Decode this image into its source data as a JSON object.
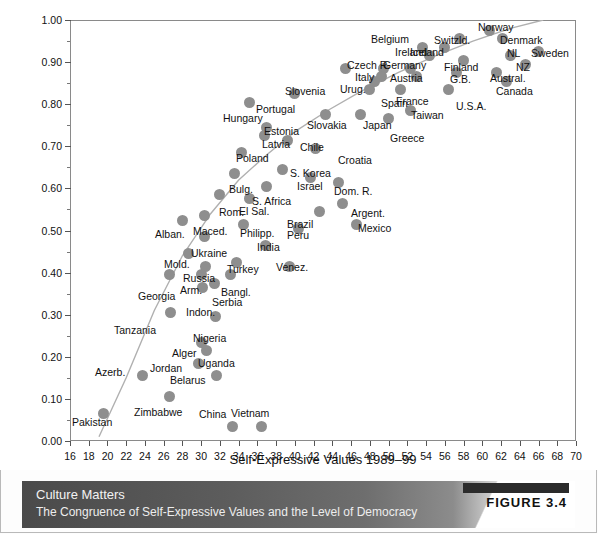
{
  "figure": {
    "tag": "FIGURE 3.4",
    "caption_title": "Culture Matters",
    "caption_subtitle": "The Congruence of Self-Expressive Values and the Level of Democracy"
  },
  "chart_data": {
    "type": "scatter",
    "title": "",
    "xlabel": "Self-Expressive Values 1989–99",
    "ylabel": "Level of Democracy 2000–04",
    "xlim": [
      16,
      70
    ],
    "ylim": [
      0.0,
      1.0
    ],
    "xticks": [
      16,
      18,
      20,
      22,
      24,
      26,
      28,
      30,
      32,
      34,
      36,
      38,
      40,
      42,
      44,
      46,
      48,
      50,
      52,
      54,
      56,
      58,
      60,
      62,
      64,
      66,
      68,
      70
    ],
    "yticks": [
      "0.00",
      "0.10",
      "0.20",
      "0.30",
      "0.40",
      "0.50",
      "0.60",
      "0.70",
      "0.80",
      "0.90",
      "1.00"
    ],
    "ytick_values": [
      0.0,
      0.1,
      0.2,
      0.3,
      0.4,
      0.5,
      0.6,
      0.7,
      0.8,
      0.9,
      1.0
    ],
    "grid": false,
    "legend": null,
    "marker_color": "#8e8e8e",
    "trend_line": {
      "style": "curve",
      "color": "#b0b0b0",
      "points": [
        [
          19.1,
          0.01
        ],
        [
          22.0,
          0.15
        ],
        [
          25.0,
          0.31
        ],
        [
          28.0,
          0.44
        ],
        [
          31.0,
          0.54
        ],
        [
          34.0,
          0.62
        ],
        [
          37.0,
          0.68
        ],
        [
          40.0,
          0.735
        ],
        [
          43.5,
          0.785
        ],
        [
          47.0,
          0.83
        ],
        [
          51.0,
          0.875
        ],
        [
          55.0,
          0.915
        ],
        [
          59.0,
          0.95
        ],
        [
          63.0,
          0.98
        ],
        [
          66.5,
          1.0
        ]
      ]
    },
    "points": [
      {
        "label": "Norway",
        "x": 60.8,
        "y": 0.975,
        "lx": 478,
        "ly": 22
      },
      {
        "label": "Switzld.",
        "x": 57.6,
        "y": 0.955,
        "lx": 434,
        "ly": 35
      },
      {
        "label": "Denmark",
        "x": 62.2,
        "y": 0.955,
        "lx": 500,
        "ly": 35
      },
      {
        "label": "Sweden",
        "x": 66.0,
        "y": 0.925,
        "lx": 531,
        "ly": 48
      },
      {
        "label": "Iceland",
        "x": 56.0,
        "y": 0.935,
        "lx": 410,
        "ly": 47
      },
      {
        "label": "Belgium",
        "x": 53.6,
        "y": 0.935,
        "lx": 371,
        "ly": 34
      },
      {
        "label": "Ireland",
        "x": 54.4,
        "y": 0.915,
        "lx": 395,
        "ly": 47
      },
      {
        "label": "NL",
        "x": 63.0,
        "y": 0.915,
        "lx": 507,
        "ly": 48
      },
      {
        "label": "Finland",
        "x": 58.0,
        "y": 0.905,
        "lx": 444,
        "ly": 62
      },
      {
        "label": "NZ",
        "x": 64.6,
        "y": 0.895,
        "lx": 516,
        "ly": 62
      },
      {
        "label": "Czech R.",
        "x": 49.5,
        "y": 0.885,
        "lx": 347,
        "ly": 60
      },
      {
        "label": "Germany",
        "x": 52.3,
        "y": 0.885,
        "lx": 383,
        "ly": 60
      },
      {
        "label": "Italy",
        "x": 49.2,
        "y": 0.865,
        "lx": 355,
        "ly": 72
      },
      {
        "label": "Austria",
        "x": 53.0,
        "y": 0.865,
        "lx": 390,
        "ly": 73
      },
      {
        "label": "G.B.",
        "x": 57.2,
        "y": 0.875,
        "lx": 450,
        "ly": 74
      },
      {
        "label": "Austral.",
        "x": 61.5,
        "y": 0.875,
        "lx": 490,
        "ly": 73
      },
      {
        "label": "Canada",
        "x": 62.6,
        "y": 0.855,
        "lx": 496,
        "ly": 86
      },
      {
        "label": "Urug.",
        "x": 48.5,
        "y": 0.855,
        "lx": 340,
        "ly": 84
      },
      {
        "label": "Slovenia",
        "x": 45.4,
        "y": 0.885,
        "lx": 285,
        "ly": 86
      },
      {
        "label": "Spain",
        "x": 48.0,
        "y": 0.835,
        "lx": 381,
        "ly": 98
      },
      {
        "label": "France",
        "x": 51.3,
        "y": 0.835,
        "lx": 396,
        "ly": 96
      },
      {
        "label": "U.S.A.",
        "x": 56.4,
        "y": 0.835,
        "lx": 456,
        "ly": 101
      },
      {
        "label": "Portugal",
        "x": 40.0,
        "y": 0.825,
        "lx": 256,
        "ly": 104
      },
      {
        "label": "Hungary",
        "x": 35.2,
        "y": 0.805,
        "lx": 223,
        "ly": 113
      },
      {
        "label": "Taiwan",
        "x": 52.3,
        "y": 0.785,
        "lx": 411,
        "ly": 110
      },
      {
        "label": "Slovakia",
        "x": 43.3,
        "y": 0.775,
        "lx": 307,
        "ly": 120
      },
      {
        "label": "Japan",
        "x": 47.0,
        "y": 0.775,
        "lx": 363,
        "ly": 120
      },
      {
        "label": "Greece",
        "x": 50.0,
        "y": 0.765,
        "lx": 390,
        "ly": 133
      },
      {
        "label": "Estonia",
        "x": 37.0,
        "y": 0.745,
        "lx": 264,
        "ly": 126
      },
      {
        "label": "Latvia",
        "x": 36.8,
        "y": 0.725,
        "lx": 262,
        "ly": 139
      },
      {
        "label": "Chile",
        "x": 39.2,
        "y": 0.715,
        "lx": 300,
        "ly": 142
      },
      {
        "label": "Croatia",
        "x": 42.2,
        "y": 0.695,
        "lx": 338,
        "ly": 155
      },
      {
        "label": "Poland",
        "x": 34.3,
        "y": 0.685,
        "lx": 236,
        "ly": 153
      },
      {
        "label": "S. Korea",
        "x": 38.7,
        "y": 0.645,
        "lx": 290,
        "ly": 168
      },
      {
        "label": "Israel",
        "x": 41.7,
        "y": 0.625,
        "lx": 297,
        "ly": 181
      },
      {
        "label": "Dom. R.",
        "x": 44.7,
        "y": 0.615,
        "lx": 334,
        "ly": 186
      },
      {
        "label": "Bulg.",
        "x": 33.6,
        "y": 0.635,
        "lx": 229,
        "ly": 184
      },
      {
        "label": "S. Africa",
        "x": 37.0,
        "y": 0.605,
        "lx": 252,
        "ly": 196
      },
      {
        "label": "Rom.",
        "x": 32.0,
        "y": 0.585,
        "lx": 219,
        "ly": 207
      },
      {
        "label": "El Sal.",
        "x": 35.1,
        "y": 0.575,
        "lx": 239,
        "ly": 206
      },
      {
        "label": "Argent.",
        "x": 45.1,
        "y": 0.565,
        "lx": 351,
        "ly": 208
      },
      {
        "label": "Brazil",
        "x": 42.6,
        "y": 0.545,
        "lx": 287,
        "ly": 219
      },
      {
        "label": "Maced.",
        "x": 30.3,
        "y": 0.535,
        "lx": 193,
        "ly": 226
      },
      {
        "label": "Alban.",
        "x": 28.0,
        "y": 0.525,
        "lx": 155,
        "ly": 229
      },
      {
        "label": "Philipp.",
        "x": 34.5,
        "y": 0.515,
        "lx": 240,
        "ly": 228
      },
      {
        "label": "Peru",
        "x": 40.4,
        "y": 0.505,
        "lx": 287,
        "ly": 230
      },
      {
        "label": "Mexico",
        "x": 46.6,
        "y": 0.515,
        "lx": 358,
        "ly": 223
      },
      {
        "label": "Ukraine",
        "x": 30.3,
        "y": 0.485,
        "lx": 191,
        "ly": 248
      },
      {
        "label": "India",
        "x": 36.9,
        "y": 0.465,
        "lx": 257,
        "ly": 242
      },
      {
        "label": "Mold.",
        "x": 28.6,
        "y": 0.445,
        "lx": 164,
        "ly": 259
      },
      {
        "label": "Turkey",
        "x": 33.8,
        "y": 0.425,
        "lx": 227,
        "ly": 264
      },
      {
        "label": "Venez.",
        "x": 39.4,
        "y": 0.415,
        "lx": 276,
        "ly": 262
      },
      {
        "label": "Russia",
        "x": 30.5,
        "y": 0.415,
        "lx": 183,
        "ly": 273
      },
      {
        "label": "Arm.",
        "x": 30.0,
        "y": 0.395,
        "lx": 180,
        "ly": 285
      },
      {
        "label": "Bangl.",
        "x": 33.1,
        "y": 0.395,
        "lx": 221,
        "ly": 287
      },
      {
        "label": "Serbia",
        "x": 31.4,
        "y": 0.375,
        "lx": 212,
        "ly": 297
      },
      {
        "label": "Georgia",
        "x": 26.6,
        "y": 0.395,
        "lx": 138,
        "ly": 291
      },
      {
        "label": "Indon.",
        "x": 30.1,
        "y": 0.365,
        "lx": 186,
        "ly": 307
      },
      {
        "label": "Tanzania",
        "x": 26.7,
        "y": 0.305,
        "lx": 114,
        "ly": 325
      },
      {
        "label": "Nigeria",
        "x": 31.5,
        "y": 0.295,
        "lx": 193,
        "ly": 333
      },
      {
        "label": "Alger",
        "x": 30.0,
        "y": 0.235,
        "lx": 172,
        "ly": 348
      },
      {
        "label": "Uganda",
        "x": 30.6,
        "y": 0.215,
        "lx": 198,
        "ly": 358
      },
      {
        "label": "Jordan",
        "x": 29.7,
        "y": 0.185,
        "lx": 150,
        "ly": 363
      },
      {
        "label": "Belarus",
        "x": 31.6,
        "y": 0.155,
        "lx": 170,
        "ly": 375
      },
      {
        "label": "Azerb.",
        "x": 23.7,
        "y": 0.155,
        "lx": 95,
        "ly": 367
      },
      {
        "label": "Zimbabwe",
        "x": 26.6,
        "y": 0.105,
        "lx": 134,
        "ly": 407
      },
      {
        "label": "Pakistan",
        "x": 19.6,
        "y": 0.065,
        "lx": 72,
        "ly": 417
      },
      {
        "label": "China",
        "x": 33.3,
        "y": 0.035,
        "lx": 199,
        "ly": 409
      },
      {
        "label": "Vietnam",
        "x": 36.4,
        "y": 0.035,
        "lx": 231,
        "ly": 408
      }
    ]
  }
}
